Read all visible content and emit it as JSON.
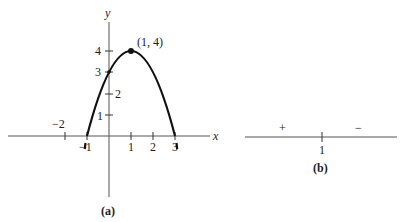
{
  "figure_a": {
    "caption": "(a)",
    "axis_x_label": "x",
    "axis_y_label": "y",
    "x_ticks": [
      "−2",
      "−1",
      "1",
      "2",
      "3"
    ],
    "y_ticks": [
      "1",
      "2",
      "3",
      "4"
    ],
    "vertex_label": "(1, 4)",
    "curve": "y = -(x-1)^2 + 4",
    "roots": [
      -1,
      3
    ],
    "y_intercept": 3,
    "vertex": [
      1,
      4
    ]
  },
  "figure_b": {
    "caption": "(b)",
    "tick_label": "1",
    "left_sign": "+",
    "right_sign": "−"
  },
  "colors": {
    "ink": "#222222",
    "axis": "#555555",
    "background": "#ffffff"
  }
}
